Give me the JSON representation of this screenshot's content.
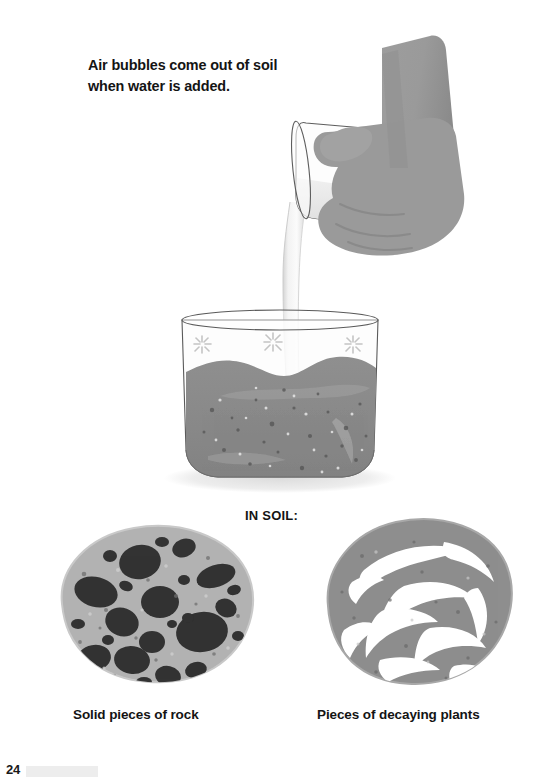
{
  "page": {
    "number": "24",
    "background_color": "#ffffff"
  },
  "heading": {
    "line1": "Air bubbles come out of soil",
    "line2": "when water is added."
  },
  "illustration": {
    "hand": {
      "label": "hand-pouring-water",
      "fill_color": "#9a9a9a",
      "shadow_color": "#878787"
    },
    "glass": {
      "label": "tilted-drinking-glass",
      "outline_color": "#555555",
      "water_color": "#e2e2e2"
    },
    "water_stream": {
      "label": "pouring-water-stream",
      "color": "#e8e8e8",
      "edge_color": "#cfcfcf"
    },
    "beaker": {
      "label": "beaker-with-soil",
      "outline_color": "#5a5a5a",
      "glass_tint": "#fbfbfb",
      "base_shadow_color": "#e6e6e6"
    },
    "soil": {
      "label": "wet-soil",
      "fill_color": "#8a8a8a",
      "speck_light_color": "#d8d8d8",
      "speck_dark_color": "#5d5d5d"
    },
    "bubbles": {
      "label": "air-bubble-sparkles",
      "count": 3,
      "color": "#c9c9c9"
    }
  },
  "in_soil": {
    "label": "IN SOIL:"
  },
  "samples": [
    {
      "id": "rock",
      "caption": "Solid pieces of rock",
      "base_color": "#b2b2b2",
      "detail_color": "#333333",
      "detail_name": "rock-fragments"
    },
    {
      "id": "plants",
      "caption": "Pieces of decaying plants",
      "base_color": "#8e8e8e",
      "detail_color": "#ffffff",
      "detail_name": "decaying-plant-pieces"
    }
  ]
}
